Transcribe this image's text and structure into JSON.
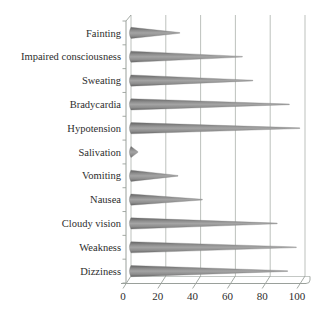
{
  "figure": {
    "title": "",
    "background_color": "#ffffff"
  },
  "chart_data": {
    "type": "bar",
    "subtype": "horizontal-cone-3d",
    "title": "",
    "xlabel": "",
    "ylabel": "",
    "categories": [
      "Fainting",
      "Impaired consciousness",
      "Sweating",
      "Bradycardia",
      "Hypotension",
      "Salivation",
      "Vomiting",
      "Nausea",
      "Cloudy vision",
      "Weakness",
      "Dizziness"
    ],
    "values": [
      28,
      64,
      70,
      91,
      97,
      4,
      27,
      41,
      84,
      95,
      90
    ],
    "xlim": [
      0,
      100
    ],
    "x_ticks": [
      0,
      20,
      40,
      60,
      80,
      100
    ],
    "grid": true,
    "legend": false,
    "colors": {
      "bar_mid": "#a4a4a4",
      "bar_body": "#8d8d8d",
      "bar_dark": "#636363",
      "bar_edge": "#7c7c7c",
      "gridline": "#b5bab6",
      "axis": "#9aa09b",
      "text": "#2d2d2d",
      "background": "#ffffff"
    }
  }
}
